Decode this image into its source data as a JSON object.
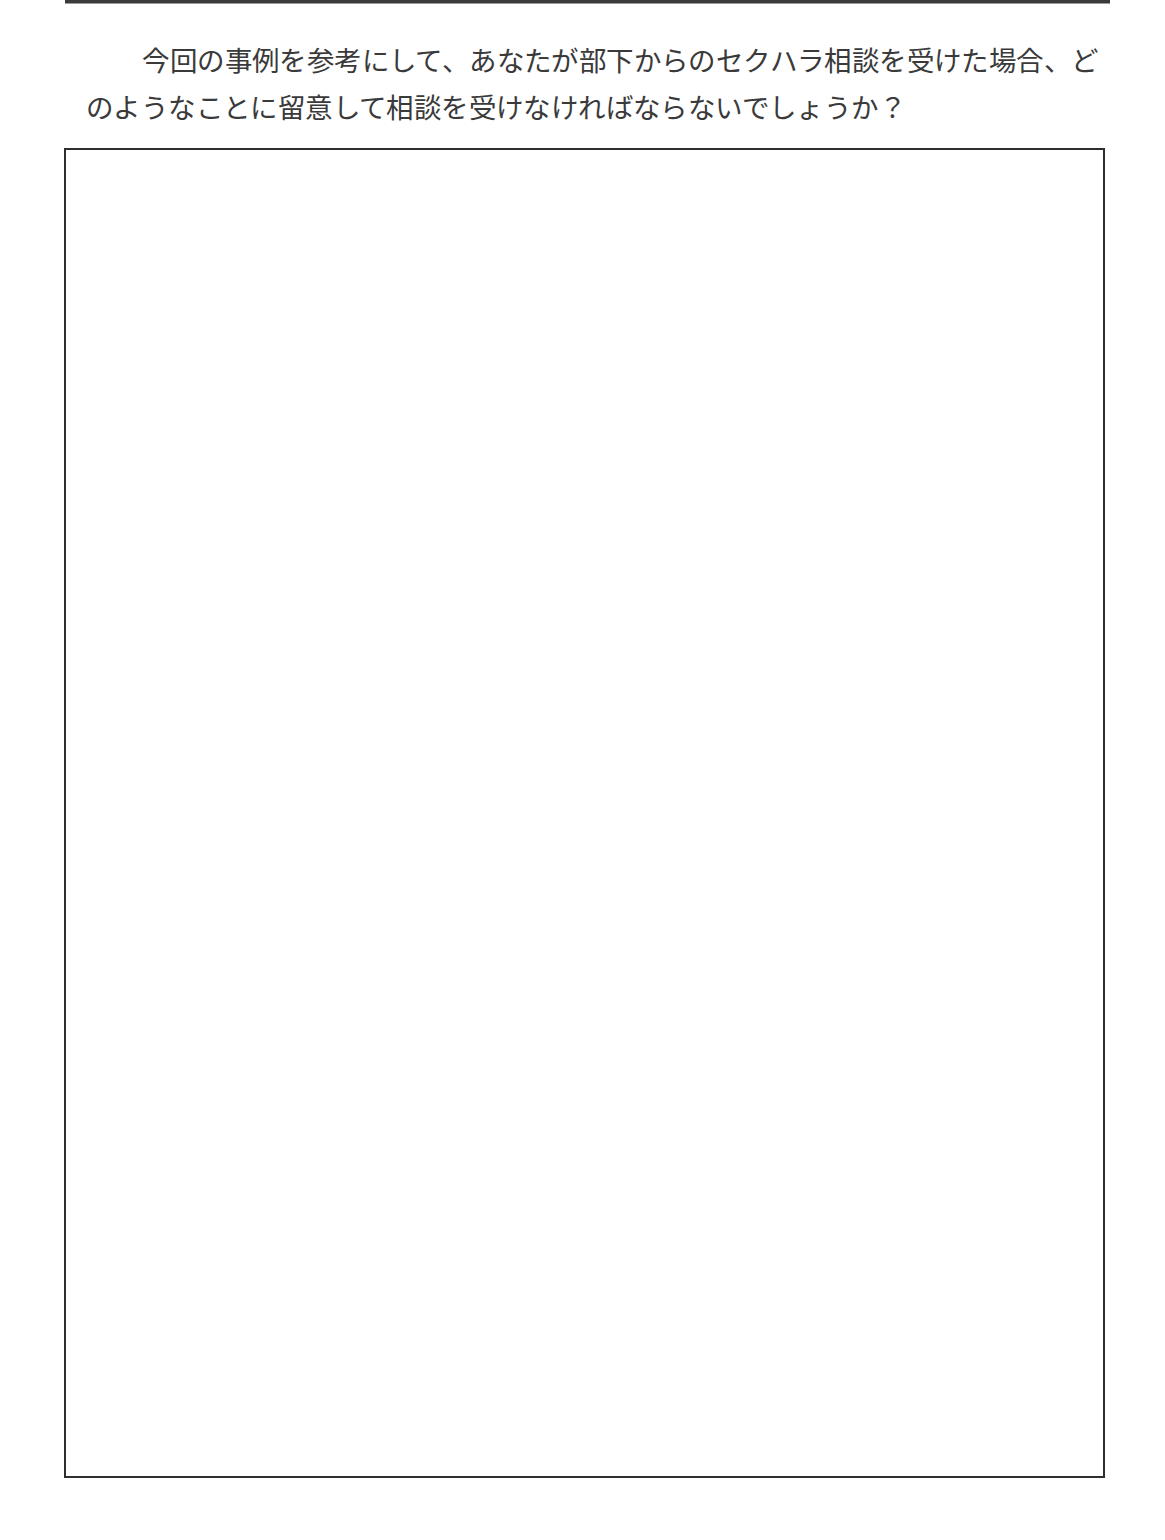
{
  "page": {
    "background_color": "#ffffff",
    "width": 1165,
    "height": 1540
  },
  "header": {
    "rule_color": "#3b3b3b"
  },
  "question": {
    "line1": "　今回の事例を参考にして、あなたが部下からのセクハラ相談を受けた場合、ど",
    "line2": "のようなことに留意して相談を受けなければならないでしょうか？",
    "text_color": "#3a3a3a"
  },
  "answer_box": {
    "border_color": "#2e2e2e",
    "value": "",
    "placeholder": ""
  }
}
